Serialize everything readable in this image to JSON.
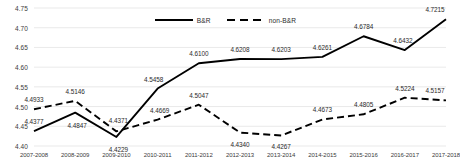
{
  "chart_data": {
    "type": "line",
    "title": "",
    "xlabel": "",
    "ylabel": "",
    "ylim": [
      4.4,
      4.75
    ],
    "ytick_step": 0.05,
    "grid": true,
    "legend_position": "top-center",
    "categories": [
      "2007-2008",
      "2008-2009",
      "2009-2010",
      "2010-2011",
      "2011-2012",
      "2012-2013",
      "2013-2014",
      "2014-2015",
      "2015-2016",
      "2016-2017",
      "2017-2018"
    ],
    "yticks": [
      "4.40",
      "4.45",
      "4.50",
      "4.55",
      "4.60",
      "4.65",
      "4.70",
      "4.75"
    ],
    "series": [
      {
        "name": "B&R",
        "style": "solid",
        "color": "#000000",
        "values": [
          4.4377,
          4.4847,
          4.4229,
          4.5458,
          4.61,
          4.6208,
          4.6203,
          4.6261,
          4.6784,
          4.6432,
          4.7215
        ],
        "labels": [
          "4.4377",
          "4.4847",
          "4.4229",
          "4.5458",
          "4.6100",
          "4.6208",
          "4.6203",
          "4.6261",
          "4.6784",
          "4.6432",
          "4.7215"
        ]
      },
      {
        "name": "non-B&R",
        "style": "dashed",
        "color": "#000000",
        "values": [
          4.4933,
          4.5146,
          4.4371,
          4.4669,
          4.5047,
          4.434,
          4.4267,
          4.4673,
          4.4805,
          4.5224,
          4.5157
        ],
        "labels": [
          "4.4933",
          "4.5146",
          "4.4371",
          "4.4669",
          "4.5047",
          "4.4340",
          "4.4267",
          "4.4673",
          "4.4805",
          "4.5224",
          "4.5157"
        ]
      }
    ]
  },
  "legend": {
    "items": [
      {
        "label": "B&R",
        "style": "solid"
      },
      {
        "label": "non-B&R",
        "style": "dashed"
      }
    ]
  },
  "colors": {
    "line": "#000000",
    "grid": "#e3e3e3",
    "tick_text": "#3b3b3b",
    "background": "#ffffff"
  }
}
